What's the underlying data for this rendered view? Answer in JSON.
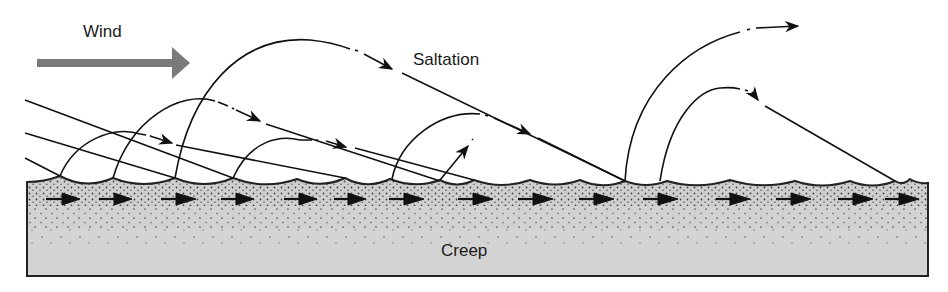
{
  "labels": {
    "wind": "Wind",
    "saltation": "Saltation",
    "creep": "Creep"
  },
  "colors": {
    "background": "#ffffff",
    "ink": "#111111",
    "wind_arrow": "#7a7a7a",
    "ground_fill": "#d2d2d2",
    "ground_dots": "#555555"
  },
  "elements": {
    "wind_arrow": {
      "direction": "right",
      "x1": 37,
      "x2": 190,
      "y": 63
    },
    "ground": {
      "x_left": 27,
      "x_right": 928,
      "y_bottom": 276,
      "surface": "rippled"
    },
    "creep_arrows_count": 15,
    "saltation_trajectories_count": 9
  }
}
